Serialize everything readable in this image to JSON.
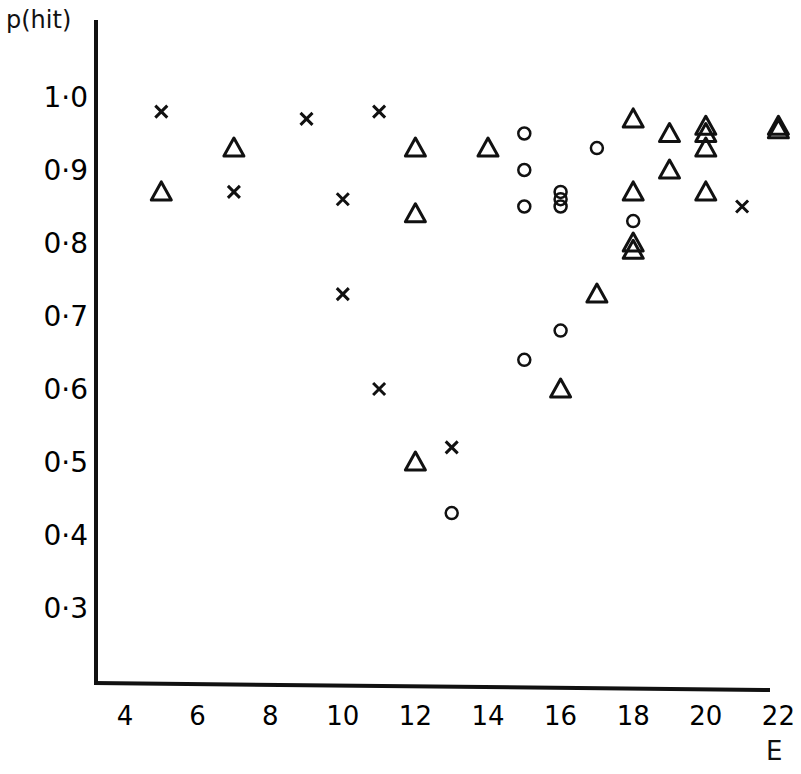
{
  "chart_data": {
    "type": "scatter",
    "title": "",
    "xlabel": "E",
    "ylabel": "p(hit)",
    "xlim": [
      3.2,
      22
    ],
    "ylim": [
      0.2,
      1.08
    ],
    "grid": false,
    "legend": "none",
    "x_ticks": [
      "4",
      "6",
      "8",
      "10",
      "12",
      "14",
      "16",
      "18",
      "20",
      "22"
    ],
    "y_ticks": [
      "1·0",
      "0·9",
      "0·8",
      "0·7",
      "0·6",
      "0·5",
      "0·4",
      "0·3"
    ],
    "series": [
      {
        "name": "cross",
        "marker": "x",
        "points": [
          [
            5,
            0.98
          ],
          [
            7,
            0.87
          ],
          [
            9,
            0.97
          ],
          [
            10,
            0.86
          ],
          [
            10,
            0.73
          ],
          [
            11,
            0.98
          ],
          [
            11,
            0.6
          ],
          [
            13,
            0.52
          ],
          [
            21,
            0.85
          ]
        ]
      },
      {
        "name": "triangle",
        "marker": "triangle",
        "points": [
          [
            5,
            0.87
          ],
          [
            7,
            0.93
          ],
          [
            12,
            0.93
          ],
          [
            12,
            0.84
          ],
          [
            12,
            0.5
          ],
          [
            14,
            0.93
          ],
          [
            16,
            0.6
          ],
          [
            17,
            0.73
          ],
          [
            18,
            0.97
          ],
          [
            18,
            0.87
          ],
          [
            18,
            0.8
          ],
          [
            18,
            0.79
          ],
          [
            19,
            0.95
          ],
          [
            19,
            0.9
          ],
          [
            20,
            0.96
          ],
          [
            20,
            0.95
          ],
          [
            20,
            0.93
          ],
          [
            20,
            0.87
          ],
          [
            22,
            0.96
          ],
          [
            22,
            0.955
          ]
        ]
      },
      {
        "name": "circle",
        "marker": "o",
        "points": [
          [
            15,
            0.95
          ],
          [
            15,
            0.9
          ],
          [
            15,
            0.85
          ],
          [
            15,
            0.64
          ],
          [
            16,
            0.87
          ],
          [
            16,
            0.86
          ],
          [
            16,
            0.85
          ],
          [
            16,
            0.68
          ],
          [
            17,
            0.93
          ],
          [
            18,
            0.83
          ],
          [
            13,
            0.43
          ]
        ]
      }
    ]
  }
}
